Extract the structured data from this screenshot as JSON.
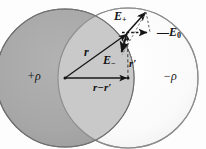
{
  "figure": {
    "colors": {
      "positive_sphere_fill": "#a8a8a8",
      "negative_sphere_fill": "#fbfbfb",
      "overlap_fill": "#c9c9c9",
      "outline": "#5a5a5a",
      "vector": "#141414",
      "background": "#fdfdfd"
    },
    "labels": {
      "e_plus": "E",
      "e_plus_sub": "+",
      "minus_e_zero_sign": "—",
      "e_zero": "E",
      "e_zero_sub": "0",
      "e_minus": "E",
      "e_minus_sub": "−",
      "r": "r",
      "r_prime": "r′",
      "r_minus_r_prime": "r−r′",
      "positive_charge_density": "+ρ",
      "negative_charge_density": "−ρ"
    },
    "geometry": {
      "positive_sphere": {
        "cx": 65,
        "cy": 78,
        "r": 69
      },
      "negative_sphere": {
        "cx": 128,
        "cy": 78,
        "r": 70
      },
      "origin": {
        "x": 65,
        "y": 78
      },
      "negative_center": {
        "x": 128,
        "y": 78
      },
      "field_point": {
        "x": 127,
        "y": 33
      },
      "e_plus_tip": {
        "x": 147,
        "y": 11
      },
      "e_minus_tip": {
        "x": 121,
        "y": 55
      },
      "e_zero_tip": {
        "x": 150,
        "y": 32
      }
    },
    "vectors": [
      {
        "name": "r",
        "from": "origin",
        "to": "field_point",
        "style": "solid"
      },
      {
        "name": "r-r'",
        "from": "origin",
        "to": "negative_center",
        "style": "solid"
      },
      {
        "name": "r'",
        "from": "negative_center",
        "to": "field_point",
        "style": "dashed"
      },
      {
        "name": "E+",
        "from": "field_point",
        "to": "e_plus_tip",
        "style": "solid"
      },
      {
        "name": "E-",
        "from": "field_point",
        "to": "e_minus_tip",
        "style": "solid"
      },
      {
        "name": "-E0",
        "from": "field_point",
        "to": "e_zero_tip",
        "style": "dashed"
      }
    ]
  }
}
